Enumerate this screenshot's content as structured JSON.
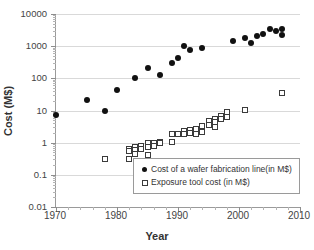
{
  "chart_data": {
    "type": "scatter",
    "title": "",
    "xlabel": "Year",
    "ylabel": "Cost (M$)",
    "xlim": [
      1970,
      2010
    ],
    "ylim": [
      0.01,
      10000
    ],
    "yscale": "log",
    "xscale": "linear",
    "grid": true,
    "legend_position": "inside-bottom-right",
    "xticks": [
      "1970",
      "1980",
      "1990",
      "2000",
      "2010"
    ],
    "xtick_values": [
      1970,
      1980,
      1990,
      2000,
      2010
    ],
    "xminor_step": 2,
    "yticks": [
      "0.01",
      "0.1",
      "1",
      "10",
      "100",
      "1000",
      "10000"
    ],
    "ytick_values": [
      0.01,
      0.1,
      1,
      10,
      100,
      1000,
      10000
    ],
    "series": [
      {
        "name": "Cost of a wafer fabrication line(in M$)",
        "marker": "filled-circle",
        "color": "#111111",
        "points": [
          [
            1970,
            7.5
          ],
          [
            1975,
            21
          ],
          [
            1978,
            10
          ],
          [
            1980,
            42
          ],
          [
            1983,
            105
          ],
          [
            1985,
            215
          ],
          [
            1987,
            130
          ],
          [
            1989,
            310
          ],
          [
            1990,
            420
          ],
          [
            1991,
            1000
          ],
          [
            1992,
            740
          ],
          [
            1994,
            850
          ],
          [
            1999,
            1500
          ],
          [
            2001,
            1850
          ],
          [
            2002,
            1250
          ],
          [
            2003,
            2100
          ],
          [
            2004,
            2400
          ],
          [
            2005,
            3500
          ],
          [
            2006,
            2900
          ],
          [
            2007,
            3300
          ],
          [
            2007,
            2200
          ]
        ]
      },
      {
        "name": "Exposure tool cost (in M$)",
        "marker": "open-square",
        "color": "#3b3b3b",
        "points": [
          [
            1978,
            0.32
          ],
          [
            1982,
            0.3
          ],
          [
            1982,
            0.62
          ],
          [
            1982,
            0.55
          ],
          [
            1983,
            0.75
          ],
          [
            1983,
            0.6
          ],
          [
            1983,
            0.45
          ],
          [
            1984,
            0.8
          ],
          [
            1984,
            0.62
          ],
          [
            1985,
            0.95
          ],
          [
            1985,
            0.72
          ],
          [
            1985,
            0.4
          ],
          [
            1986,
            1.0
          ],
          [
            1986,
            0.8
          ],
          [
            1987,
            1.05
          ],
          [
            1987,
            0.95
          ],
          [
            1989,
            1.8
          ],
          [
            1989,
            1.05
          ],
          [
            1990,
            1.9
          ],
          [
            1991,
            2.3
          ],
          [
            1991,
            1.9
          ],
          [
            1992,
            2.4
          ],
          [
            1992,
            2.0
          ],
          [
            1993,
            2.6
          ],
          [
            1993,
            1.8
          ],
          [
            1994,
            3.2
          ],
          [
            1994,
            2.1
          ],
          [
            1995,
            4.6
          ],
          [
            1995,
            3.6
          ],
          [
            1996,
            5.3
          ],
          [
            1996,
            4.4
          ],
          [
            1996,
            3.0
          ],
          [
            1997,
            6.6
          ],
          [
            1997,
            5.4
          ],
          [
            1998,
            8.0
          ],
          [
            1998,
            9.0
          ],
          [
            1998,
            6.2
          ],
          [
            2001,
            10.5
          ],
          [
            2007,
            35
          ]
        ]
      }
    ]
  }
}
